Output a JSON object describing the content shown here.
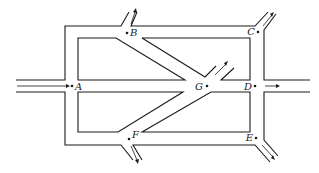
{
  "diagram": {
    "type": "road-network",
    "nodes": [
      {
        "id": "A",
        "label": "A",
        "x": 72,
        "y": 86,
        "label_dx": 3,
        "label_dy": 4,
        "anchor": "start"
      },
      {
        "id": "B",
        "label": "B",
        "x": 127,
        "y": 33,
        "label_dx": 3,
        "label_dy": 3,
        "anchor": "start"
      },
      {
        "id": "C",
        "label": "C",
        "x": 258,
        "y": 32,
        "label_dx": -3,
        "label_dy": 3,
        "anchor": "end"
      },
      {
        "id": "D",
        "label": "D",
        "x": 255,
        "y": 86,
        "label_dx": -3,
        "label_dy": 4,
        "anchor": "end"
      },
      {
        "id": "E",
        "label": "E",
        "x": 256,
        "y": 138,
        "label_dx": -3,
        "label_dy": 3,
        "anchor": "end"
      },
      {
        "id": "F",
        "label": "F",
        "x": 129,
        "y": 139,
        "label_dx": 3,
        "label_dy": -1,
        "anchor": "start"
      },
      {
        "id": "G",
        "label": "G",
        "x": 207,
        "y": 86,
        "label_dx": -4,
        "label_dy": 4,
        "anchor": "end"
      }
    ],
    "flows": [
      {
        "id": "in-A",
        "from": "left edge",
        "to": "A",
        "direction": "inbound"
      },
      {
        "id": "out-B",
        "from": "B",
        "to": "top",
        "direction": "outbound"
      },
      {
        "id": "out-C",
        "from": "C",
        "to": "top-right",
        "direction": "outbound"
      },
      {
        "id": "out-D",
        "from": "D",
        "to": "right edge",
        "direction": "outbound"
      },
      {
        "id": "out-E",
        "from": "E",
        "to": "bottom-right",
        "direction": "outbound"
      },
      {
        "id": "out-F",
        "from": "F",
        "to": "bottom",
        "direction": "outbound"
      },
      {
        "id": "out-G",
        "from": "G",
        "to": "top-right stub",
        "direction": "outbound"
      }
    ]
  }
}
